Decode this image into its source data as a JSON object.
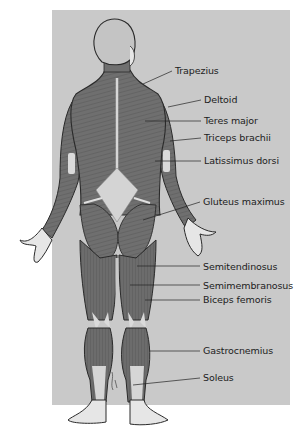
{
  "diagram": {
    "colors": {
      "background": "#c9c9c9",
      "muscle": "#6f6f6f",
      "outline": "#2a2a2a",
      "tendon": "#dadada",
      "skin": "#e6e6e6"
    },
    "labels": [
      {
        "id": "trapezius",
        "text": "Trapezius",
        "x": 175,
        "y": 66,
        "line_from": [
          143,
          84
        ],
        "line_to": [
          172,
          71
        ]
      },
      {
        "id": "deltoid",
        "text": "Deltoid",
        "x": 204,
        "y": 95,
        "line_from": [
          168,
          107
        ],
        "line_to": [
          201,
          100
        ]
      },
      {
        "id": "teres-major",
        "text": "Teres major",
        "x": 204,
        "y": 116,
        "line_from": [
          145,
          121
        ],
        "line_to": [
          201,
          121
        ]
      },
      {
        "id": "triceps-brachii",
        "text": "Triceps brachii",
        "x": 204,
        "y": 133,
        "line_from": [
          170,
          141
        ],
        "line_to": [
          201,
          138
        ]
      },
      {
        "id": "latissimus-dorsi",
        "text": "Latissimus dorsi",
        "x": 204,
        "y": 156,
        "line_from": [
          155,
          161
        ],
        "line_to": [
          201,
          161
        ]
      },
      {
        "id": "gluteus-maximus",
        "text": "Gluteus maximus",
        "x": 203,
        "y": 197,
        "line_from": [
          143,
          220
        ],
        "line_to": [
          200,
          202
        ]
      },
      {
        "id": "semitendinosus",
        "text": "Semitendinosus",
        "x": 203,
        "y": 262,
        "line_from": [
          137,
          266
        ],
        "line_to": [
          200,
          266
        ]
      },
      {
        "id": "semimembranosus",
        "text": "Semimembranosus",
        "x": 203,
        "y": 281,
        "line_from": [
          130,
          285
        ],
        "line_to": [
          200,
          285
        ]
      },
      {
        "id": "biceps-femoris",
        "text": "Biceps femoris",
        "x": 203,
        "y": 295,
        "line_from": [
          145,
          300
        ],
        "line_to": [
          200,
          300
        ]
      },
      {
        "id": "gastrocnemius",
        "text": "Gastrocnemius",
        "x": 203,
        "y": 346,
        "line_from": [
          150,
          351
        ],
        "line_to": [
          200,
          351
        ]
      },
      {
        "id": "soleus",
        "text": "Soleus",
        "x": 203,
        "y": 373,
        "line_from": [
          133,
          385
        ],
        "line_to": [
          200,
          378
        ]
      }
    ],
    "signature": "artist signature (illegible)"
  }
}
